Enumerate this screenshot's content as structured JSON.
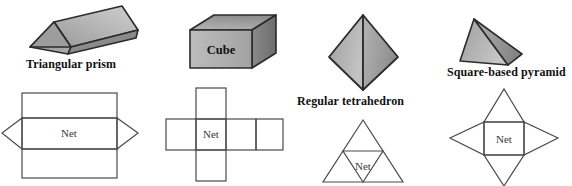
{
  "page": {
    "background": "#ffffff",
    "width": 572,
    "height": 186,
    "cropped_header_text": "solids and the nets that make them."
  },
  "palette": {
    "outline": "#2b2b2b",
    "net_outline": "#4a4a4a",
    "face_light": "#d9d9d9",
    "face_mid": "#a8a8a8",
    "face_dark": "#7d7d7d",
    "face_darker": "#6a6a6a",
    "text": "#111111",
    "net_label_color": "#3a3a3a"
  },
  "net_label": "Net",
  "columns": [
    {
      "id": "triangular-prism",
      "label": "Triangular prism",
      "label_position": "below-solid",
      "solid_label": null,
      "net_label": "Net",
      "net_description": "Three rectangles stacked with a triangle on each side of the middle rectangle"
    },
    {
      "id": "cube",
      "label": "Cube",
      "label_position": "on-solid",
      "solid_label": "Cube",
      "net_label": "Net",
      "net_description": "Cross shaped net of six squares"
    },
    {
      "id": "regular-tetrahedron",
      "label": "Regular tetrahedron",
      "label_position": "below-solid",
      "solid_label": null,
      "net_label": "Net",
      "net_description": "Large triangle divided into four smaller triangles"
    },
    {
      "id": "square-based-pyramid",
      "label": "Square-based pyramid",
      "label_position": "below-solid",
      "solid_label": null,
      "net_label": "Net",
      "net_description": "Central square with a triangle on each of its four sides"
    }
  ]
}
